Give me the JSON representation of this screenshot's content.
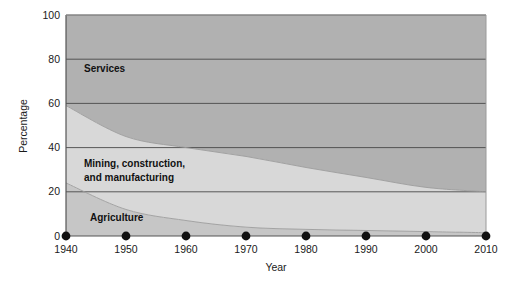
{
  "chart_data": {
    "type": "area",
    "stacked": true,
    "title": "",
    "xlabel": "Year",
    "ylabel": "Percentage",
    "xlim": [
      1940,
      2010
    ],
    "ylim": [
      0,
      100
    ],
    "grid": true,
    "legend_position": "inline-labels",
    "x_tick_labels": [
      "1940",
      "1950",
      "1960",
      "1970",
      "1980",
      "1990",
      "2000",
      "2010"
    ],
    "y_tick_labels": [
      "0",
      "20",
      "40",
      "60",
      "80",
      "100"
    ],
    "x": [
      1940,
      1950,
      1960,
      1970,
      1980,
      1990,
      2000,
      2010
    ],
    "y_ticks": [
      0,
      20,
      40,
      60,
      80,
      100
    ],
    "series": [
      {
        "name": "Agriculture",
        "color": "#c6c6c6",
        "values": [
          24,
          12,
          7,
          4,
          3,
          2.5,
          2,
          1.5
        ]
      },
      {
        "name": "Mining, construction, and manufacturing",
        "color": "#d8d8d8",
        "values": [
          35,
          33,
          33,
          32,
          28,
          24,
          20,
          18.5
        ]
      },
      {
        "name": "Services",
        "color": "#b1b1b1",
        "values": [
          41,
          55,
          60,
          64,
          69,
          73.5,
          78,
          80
        ]
      }
    ],
    "series_labels": [
      {
        "text": "Services",
        "x_value": 1943,
        "y_value": 74
      },
      {
        "text": "Mining, construction,",
        "x_value": 1943,
        "y_value": 31
      },
      {
        "text": "and manufacturing",
        "x_value": 1943,
        "y_value": 25
      },
      {
        "text": "Agriculture",
        "x_value": 1944,
        "y_value": 7
      }
    ],
    "marker_shape": "filled-circle",
    "marker_color": "#111111",
    "axis_color": "#555555",
    "gridline_color": "#4a4a4a",
    "background_color": "#ffffff"
  }
}
